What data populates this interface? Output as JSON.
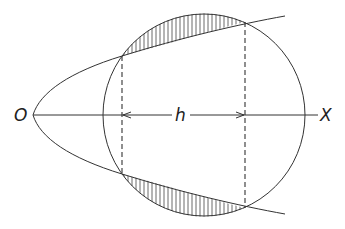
{
  "diagram": {
    "labels": {
      "origin": "O",
      "axis": "X",
      "distance": "h"
    },
    "colors": {
      "stroke": "#333333",
      "background": "#ffffff"
    }
  }
}
